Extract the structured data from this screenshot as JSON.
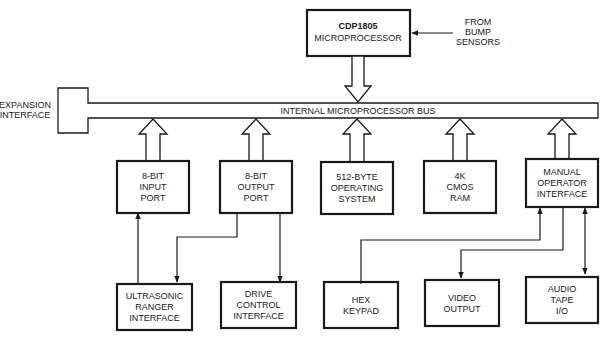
{
  "diagram": {
    "microprocessor": {
      "line1": "CDP1805",
      "line2": "MICROPROCESSOR"
    },
    "bump_sensors": {
      "line1": "FROM",
      "line2": "BUMP",
      "line3": "SENSORS"
    },
    "expansion": {
      "line1": "EXPANSION",
      "line2": "INTERFACE"
    },
    "bus": {
      "label": "INTERNAL MICROPROCESSOR BUS"
    },
    "mid_blocks": [
      {
        "lines": [
          "8-BIT",
          "INPUT",
          "PORT"
        ]
      },
      {
        "lines": [
          "8-BIT",
          "OUTPUT",
          "PORT"
        ]
      },
      {
        "lines": [
          "512-BYTE",
          "OPERATING",
          "SYSTEM"
        ]
      },
      {
        "lines": [
          "4K",
          "CMOS",
          "RAM"
        ]
      },
      {
        "lines": [
          "MANUAL",
          "OPERATOR",
          "INTERFACE"
        ]
      }
    ],
    "bottom_blocks": [
      {
        "lines": [
          "ULTRASONIC",
          "RANGER",
          "INTERFACE"
        ]
      },
      {
        "lines": [
          "DRIVE",
          "CONTROL",
          "INTERFACE"
        ]
      },
      {
        "lines": [
          "HEX",
          "KEYPAD"
        ]
      },
      {
        "lines": [
          "VIDEO",
          "OUTPUT"
        ]
      },
      {
        "lines": [
          "AUDIO",
          "TAPE",
          "I/O"
        ]
      }
    ]
  }
}
